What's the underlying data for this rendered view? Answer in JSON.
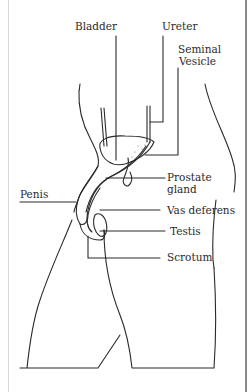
{
  "diagram": {
    "type": "anatomical-illustration",
    "labels": {
      "bladder": "Bladder",
      "ureter": "Ureter",
      "seminal_vesicle_1": "Seminal",
      "seminal_vesicle_2": "Vesicle",
      "prostate_1": "Prostate",
      "prostate_2": "gland",
      "penis": "Penis",
      "vas_deferens": "Vas deferens",
      "testis": "Testis",
      "scrotum": "Scrotum"
    },
    "colors": {
      "line": "#2a2a2a",
      "background": "#ffffff",
      "frame_right": "#8a8a8a",
      "frame_left": "#d8d8d8"
    }
  }
}
